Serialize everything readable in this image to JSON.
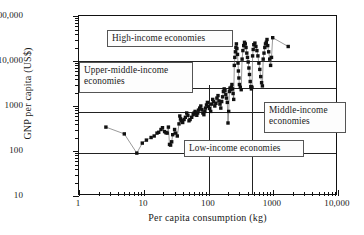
{
  "chart_data": {
    "type": "scatter",
    "title": "",
    "xlabel": "Per capita consumption (kg)",
    "ylabel": "GNP per capita (US$)",
    "xscale": "log",
    "yscale": "log",
    "xlim": [
      1,
      10000
    ],
    "ylim": [
      10,
      100000
    ],
    "xticks": [
      "1",
      "10",
      "100",
      "1000",
      "10,000"
    ],
    "xtick_values": [
      1,
      10,
      100,
      1000,
      10000
    ],
    "yticks": [
      "10",
      "100",
      "1000",
      "10,000",
      "100,000"
    ],
    "ytick_values": [
      10,
      100,
      1000,
      10000,
      100000
    ],
    "grid": "threshold-lines-only",
    "legend": "none",
    "marker": "filled-square",
    "marker_color": "#111111",
    "line_color": "#555555",
    "connected": true,
    "gridlines_y": [
      90,
      755,
      2500,
      10000
    ],
    "gridlines_x": [
      100,
      470
    ],
    "annotations": [
      {
        "name": "high-income-economies",
        "text": "High-income economies"
      },
      {
        "name": "upper-middle-income-economies",
        "text": "Upper-middle-income economies"
      },
      {
        "name": "middle-income-economies",
        "text": "Middle-income economies"
      },
      {
        "name": "low-income-economies",
        "text": "Low-income economies"
      }
    ],
    "points": [
      [
        2.6,
        340
      ],
      [
        5.0,
        240
      ],
      [
        7.8,
        90
      ],
      [
        9.5,
        150
      ],
      [
        11,
        175
      ],
      [
        13,
        200
      ],
      [
        14.5,
        215
      ],
      [
        16,
        250
      ],
      [
        17,
        260
      ],
      [
        18.5,
        300
      ],
      [
        19.5,
        330
      ],
      [
        21,
        270
      ],
      [
        22,
        255
      ],
      [
        23,
        250
      ],
      [
        24,
        340
      ],
      [
        25,
        140
      ],
      [
        26,
        135
      ],
      [
        27,
        160
      ],
      [
        28,
        230
      ],
      [
        30,
        300
      ],
      [
        31,
        250
      ],
      [
        33,
        215
      ],
      [
        35,
        400
      ],
      [
        36,
        600
      ],
      [
        37,
        520
      ],
      [
        38,
        470
      ],
      [
        40,
        430
      ],
      [
        42,
        500
      ],
      [
        44,
        560
      ],
      [
        46,
        700
      ],
      [
        48,
        620
      ],
      [
        50,
        470
      ],
      [
        52,
        500
      ],
      [
        55,
        560
      ],
      [
        58,
        640
      ],
      [
        60,
        700
      ],
      [
        62,
        760
      ],
      [
        64,
        680
      ],
      [
        66,
        620
      ],
      [
        68,
        700
      ],
      [
        70,
        810
      ],
      [
        73,
        900
      ],
      [
        76,
        1000
      ],
      [
        79,
        830
      ],
      [
        82,
        700
      ],
      [
        85,
        640
      ],
      [
        88,
        760
      ],
      [
        90,
        900
      ],
      [
        93,
        1050
      ],
      [
        96,
        1200
      ],
      [
        100,
        980
      ],
      [
        104,
        880
      ],
      [
        108,
        760
      ],
      [
        112,
        1100
      ],
      [
        116,
        1400
      ],
      [
        120,
        1250
      ],
      [
        125,
        1000
      ],
      [
        130,
        1150
      ],
      [
        135,
        1500
      ],
      [
        140,
        1700
      ],
      [
        145,
        1300
      ],
      [
        150,
        1100
      ],
      [
        155,
        900
      ],
      [
        160,
        1250
      ],
      [
        165,
        1600
      ],
      [
        170,
        2100
      ],
      [
        175,
        2400
      ],
      [
        180,
        2200
      ],
      [
        185,
        1800
      ],
      [
        190,
        1500
      ],
      [
        195,
        1200
      ],
      [
        200,
        420
      ],
      [
        205,
        760
      ],
      [
        210,
        2100
      ],
      [
        215,
        2500
      ],
      [
        220,
        2300
      ],
      [
        225,
        2600
      ],
      [
        230,
        3000
      ],
      [
        235,
        2400
      ],
      [
        240,
        1900
      ],
      [
        245,
        1400
      ],
      [
        250,
        8000
      ],
      [
        255,
        12000
      ],
      [
        260,
        16000
      ],
      [
        265,
        20000
      ],
      [
        270,
        24000
      ],
      [
        275,
        19000
      ],
      [
        280,
        14000
      ],
      [
        285,
        9000
      ],
      [
        290,
        6000
      ],
      [
        295,
        4200
      ],
      [
        300,
        3000
      ],
      [
        310,
        2600
      ],
      [
        320,
        2300
      ],
      [
        330,
        11000
      ],
      [
        340,
        17000
      ],
      [
        350,
        22000
      ],
      [
        360,
        26000
      ],
      [
        370,
        24000
      ],
      [
        380,
        20000
      ],
      [
        390,
        15000
      ],
      [
        400,
        12000
      ],
      [
        410,
        9500
      ],
      [
        420,
        7000
      ],
      [
        430,
        5000
      ],
      [
        440,
        3500
      ],
      [
        450,
        2700
      ],
      [
        460,
        2400
      ],
      [
        470,
        2600
      ],
      [
        480,
        13000
      ],
      [
        490,
        18000
      ],
      [
        500,
        23000
      ],
      [
        520,
        25000
      ],
      [
        540,
        21000
      ],
      [
        560,
        17000
      ],
      [
        580,
        13000
      ],
      [
        600,
        9000
      ],
      [
        620,
        6500
      ],
      [
        640,
        4500
      ],
      [
        660,
        3300
      ],
      [
        680,
        2800
      ],
      [
        700,
        11000
      ],
      [
        720,
        15000
      ],
      [
        740,
        20000
      ],
      [
        760,
        24000
      ],
      [
        780,
        26000
      ],
      [
        800,
        30000
      ],
      [
        820,
        22000
      ],
      [
        850,
        16000
      ],
      [
        880,
        11000
      ],
      [
        910,
        8000
      ],
      [
        940,
        12000
      ],
      [
        980,
        33000
      ],
      [
        1700,
        21000
      ]
    ]
  },
  "axes": {
    "y_title": "GNP per capita (US$)",
    "x_title": "Per capita consumption (kg)",
    "y_tick_labels": [
      "100,000",
      "10,000",
      "1000",
      "100",
      "10"
    ],
    "x_tick_labels": [
      "1",
      "10",
      "100",
      "1000",
      "10,000"
    ]
  },
  "callouts": {
    "high": "High-income economies",
    "upper_middle_line1": "Upper-middle-income",
    "upper_middle_line2": "economies",
    "middle_line1": "Middle-income",
    "middle_line2": "economies",
    "low": "Low-income economies"
  }
}
